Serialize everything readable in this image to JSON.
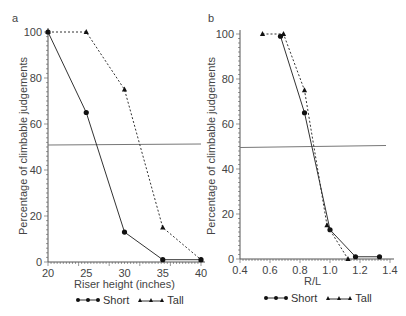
{
  "chart_data": [
    {
      "panel": "a",
      "type": "line",
      "xlabel": "Riser height (inches)",
      "ylabel": "Percentage of climbable judgements",
      "x": [
        20,
        25,
        30,
        35,
        40
      ],
      "xticks": [
        "20",
        "25",
        "30",
        "35",
        "40"
      ],
      "yticks": [
        "0",
        "20",
        "40",
        "60",
        "80",
        "100"
      ],
      "xlim": [
        20,
        40
      ],
      "ylim": [
        0,
        100
      ],
      "reference_line_y": 50,
      "series": [
        {
          "name": "Short",
          "marker": "circle",
          "style": "solid",
          "x": [
            20,
            25,
            30,
            35,
            40
          ],
          "values": [
            100,
            65,
            13,
            1,
            1
          ]
        },
        {
          "name": "Tall",
          "marker": "triangle",
          "style": "dashed",
          "x": [
            20,
            25,
            30,
            35,
            40
          ],
          "values": [
            100,
            100,
            75,
            15,
            1
          ]
        }
      ],
      "legend_position": "bottom"
    },
    {
      "panel": "b",
      "type": "line",
      "xlabel": "R/L",
      "ylabel": "Percentage of climbable judgements",
      "xticks": [
        "0.4",
        "0.6",
        "0.8",
        "1.0",
        "1.2",
        "1.4"
      ],
      "yticks": [
        "0",
        "20",
        "40",
        "60",
        "80",
        "100"
      ],
      "xlim": [
        0.4,
        1.4
      ],
      "ylim": [
        0,
        100
      ],
      "reference_line_y": 50,
      "series": [
        {
          "name": "Short",
          "marker": "circle",
          "style": "solid",
          "x": [
            0.67,
            0.83,
            1.0,
            1.17,
            1.33
          ],
          "values": [
            99,
            65,
            13,
            1,
            1
          ]
        },
        {
          "name": "Tall",
          "marker": "triangle",
          "style": "dashed",
          "x": [
            0.55,
            0.69,
            0.83,
            0.98,
            1.12
          ],
          "values": [
            100,
            100,
            75,
            15,
            0
          ]
        }
      ],
      "legend_position": "bottom"
    }
  ],
  "labels": {
    "panel_a": "a",
    "panel_b": "b",
    "a_xlabel": "Riser height (inches)",
    "b_xlabel": "R/L",
    "ylabel": "Percentage of climbable judgements",
    "legend_short": "Short",
    "legend_tall": "Tall"
  },
  "colors": {
    "axis": "#555555",
    "line": "#333333",
    "refline": "#777777"
  }
}
